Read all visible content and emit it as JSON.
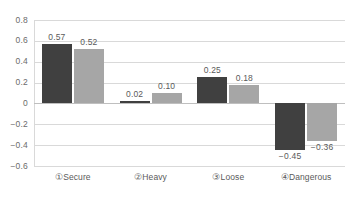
{
  "chart_data": {
    "type": "bar",
    "title": "",
    "xlabel": "",
    "ylabel": "",
    "categories": [
      "①Secure",
      "②Heavy",
      "③Loose",
      "④Dangerous"
    ],
    "series": [
      {
        "name": "series-1",
        "color": "#404040",
        "values": [
          0.57,
          0.02,
          0.25,
          -0.45
        ],
        "labels": [
          "0.57",
          "0.02",
          "0.25",
          "−0.45"
        ]
      },
      {
        "name": "series-2",
        "color": "#a6a6a6",
        "values": [
          0.52,
          0.1,
          0.18,
          -0.36
        ],
        "labels": [
          "0.52",
          "0.10",
          "0.18",
          "−0.36"
        ]
      }
    ],
    "ylim": [
      -0.6,
      0.8
    ],
    "ytick_values": [
      0.8,
      0.6,
      0.4,
      0.2,
      0,
      -0.2,
      -0.4,
      -0.6
    ],
    "ytick_labels": [
      "0.8",
      "0.6",
      "0.4",
      "0.2",
      "0",
      "−0.2",
      "−0.4",
      "−0.6"
    ],
    "grid": true,
    "legend": "none",
    "background_color": "#ffffff",
    "gridline_color": "#d9d9d9",
    "text_color": "#5a5a5a"
  }
}
